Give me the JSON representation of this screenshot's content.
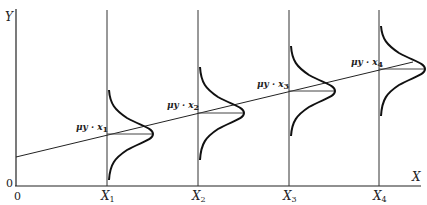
{
  "diagram": {
    "type": "regression-normal-distributions",
    "y_axis_label": "Y",
    "x_axis_label": "X",
    "origin_x_label": "0",
    "origin_y_label": "0",
    "x_ticks": [
      {
        "base": "X",
        "sub": "1"
      },
      {
        "base": "X",
        "sub": "2"
      },
      {
        "base": "X",
        "sub": "3"
      },
      {
        "base": "X",
        "sub": "4"
      }
    ],
    "mean_labels": [
      {
        "text": "μy · x",
        "sub": "1"
      },
      {
        "text": "μy · x",
        "sub": "2"
      },
      {
        "text": "μy · x",
        "sub": "3"
      },
      {
        "text": "μy · x",
        "sub": "4"
      }
    ],
    "regression_line": {
      "description": "straight line through conditional means μy·x"
    },
    "distributions": "identical normal curves centered on regression line at each X"
  }
}
